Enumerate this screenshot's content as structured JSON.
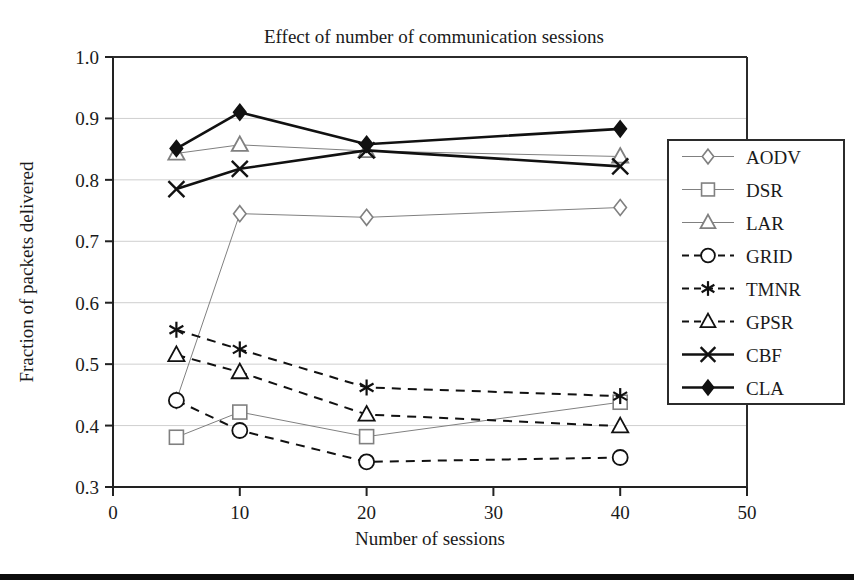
{
  "figure": {
    "background": "#ffffff",
    "footer_rule_color": "#0d0d0d"
  },
  "chart_data": {
    "type": "line",
    "title": "Effect of number of communication sessions",
    "xlabel": "Number of sessions",
    "ylabel": "Fraction of packets delivered",
    "x": [
      5,
      10,
      20,
      40
    ],
    "xlim": [
      0,
      50
    ],
    "ylim": [
      0.3,
      1.0
    ],
    "xticks": [
      0,
      10,
      20,
      30,
      40,
      50
    ],
    "xtick_labels": [
      "0",
      "10",
      "20",
      "30",
      "40",
      "50"
    ],
    "yticks": [
      0.3,
      0.4,
      0.5,
      0.6,
      0.7,
      0.8,
      0.9,
      1.0
    ],
    "ytick_labels": [
      "0.3",
      "0.4",
      "0.5",
      "0.6",
      "0.7",
      "0.8",
      "0.9",
      "1.0"
    ],
    "grid": "horizontal",
    "legend_position": "right-outside",
    "series": [
      {
        "name": "AODV",
        "marker": "diamond-open",
        "linestyle": "solid",
        "color": "#808080",
        "linewidth": 1,
        "values": [
          0.441,
          0.745,
          0.739,
          0.755
        ],
        "points": [
          {
            "x": 5,
            "y": 0.441
          },
          {
            "x": 10,
            "y": 0.745
          },
          {
            "x": 20,
            "y": 0.739
          },
          {
            "x": 40,
            "y": 0.755
          }
        ]
      },
      {
        "name": "DSR",
        "marker": "square-open",
        "linestyle": "solid",
        "color": "#808080",
        "linewidth": 1,
        "values": [
          0.381,
          0.422,
          0.382,
          0.438
        ],
        "points": [
          {
            "x": 5,
            "y": 0.381
          },
          {
            "x": 10,
            "y": 0.422
          },
          {
            "x": 20,
            "y": 0.382
          },
          {
            "x": 40,
            "y": 0.438
          }
        ]
      },
      {
        "name": "LAR",
        "marker": "triangle-open",
        "linestyle": "solid",
        "color": "#808080",
        "linewidth": 1,
        "values": [
          0.843,
          0.857,
          0.847,
          0.838
        ],
        "points": [
          {
            "x": 5,
            "y": 0.843
          },
          {
            "x": 10,
            "y": 0.857
          },
          {
            "x": 20,
            "y": 0.847
          },
          {
            "x": 40,
            "y": 0.838
          }
        ]
      },
      {
        "name": "GRID",
        "marker": "circle-open",
        "linestyle": "dashed",
        "color": "#111111",
        "linewidth": 2,
        "values": [
          0.441,
          0.392,
          0.341,
          0.348
        ],
        "points": [
          {
            "x": 5,
            "y": 0.441
          },
          {
            "x": 10,
            "y": 0.392
          },
          {
            "x": 20,
            "y": 0.341
          },
          {
            "x": 40,
            "y": 0.348
          }
        ]
      },
      {
        "name": "TMNR",
        "marker": "asterisk",
        "linestyle": "dashed",
        "color": "#111111",
        "linewidth": 2,
        "values": [
          0.556,
          0.524,
          0.462,
          0.448
        ],
        "points": [
          {
            "x": 5,
            "y": 0.556
          },
          {
            "x": 10,
            "y": 0.524
          },
          {
            "x": 20,
            "y": 0.462
          },
          {
            "x": 40,
            "y": 0.448
          }
        ]
      },
      {
        "name": "GPSR",
        "marker": "triangle-open",
        "linestyle": "dashed",
        "color": "#111111",
        "linewidth": 2,
        "values": [
          0.515,
          0.487,
          0.418,
          0.399
        ],
        "points": [
          {
            "x": 5,
            "y": 0.515
          },
          {
            "x": 10,
            "y": 0.487
          },
          {
            "x": 20,
            "y": 0.418
          },
          {
            "x": 40,
            "y": 0.399
          }
        ]
      },
      {
        "name": "CBF",
        "marker": "x-cross",
        "linestyle": "solid",
        "color": "#111111",
        "linewidth": 2.6,
        "values": [
          0.785,
          0.818,
          0.848,
          0.822
        ],
        "points": [
          {
            "x": 5,
            "y": 0.785
          },
          {
            "x": 10,
            "y": 0.818
          },
          {
            "x": 20,
            "y": 0.848
          },
          {
            "x": 40,
            "y": 0.822
          }
        ]
      },
      {
        "name": "CLA",
        "marker": "diamond-filled",
        "linestyle": "solid",
        "color": "#111111",
        "linewidth": 2.6,
        "values": [
          0.851,
          0.91,
          0.858,
          0.883
        ],
        "points": [
          {
            "x": 5,
            "y": 0.851
          },
          {
            "x": 10,
            "y": 0.91
          },
          {
            "x": 20,
            "y": 0.858
          },
          {
            "x": 40,
            "y": 0.883
          }
        ]
      }
    ]
  },
  "legend": {
    "entries": [
      "AODV",
      "DSR",
      "LAR",
      "GRID",
      "TMNR",
      "GPSR",
      "CBF",
      "CLA"
    ]
  }
}
